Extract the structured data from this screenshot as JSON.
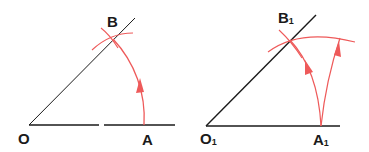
{
  "colors": {
    "ink": "#1a1a1a",
    "construction": "#ee5a5a",
    "background": "#ffffff"
  },
  "figures": [
    {
      "name": "original-angle",
      "labels": {
        "vertex": "O",
        "point_on_base": "A",
        "point_on_ray": "B"
      }
    },
    {
      "name": "copied-angle",
      "labels": {
        "vertex": "O",
        "vertex_sub": "1",
        "point_on_base": "A",
        "point_on_base_sub": "1",
        "point_on_ray": "B",
        "point_on_ray_sub": "1"
      }
    }
  ]
}
